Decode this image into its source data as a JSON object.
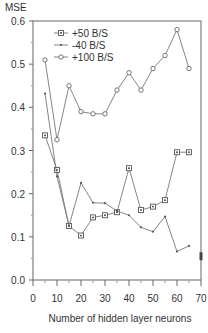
{
  "chart_data": {
    "type": "line",
    "title": "",
    "ylabel": "MSE",
    "xlabel": "Number of hidden layer neurons",
    "xlim": [
      0,
      70
    ],
    "ylim": [
      0.0,
      0.6
    ],
    "xticks": [
      0,
      10,
      20,
      30,
      40,
      50,
      60,
      70
    ],
    "xtick_labels": [
      "0",
      "10",
      "20",
      "30",
      "40",
      "50",
      "60",
      "70"
    ],
    "yticks": [
      0.0,
      0.1,
      0.2,
      0.3,
      0.4,
      0.5,
      0.6
    ],
    "ytick_labels": [
      "0.0",
      "0.1",
      "0.2",
      "0.3",
      "0.4",
      "0.5",
      "0.6"
    ],
    "grid": false,
    "legend_position": "upper left",
    "series": [
      {
        "name": "+50 B/S",
        "marker": "boxed-dot",
        "x": [
          5,
          10,
          15,
          20,
          25,
          30,
          35,
          40,
          45,
          50,
          55,
          60,
          65
        ],
        "values": [
          0.335,
          0.255,
          0.125,
          0.103,
          0.145,
          0.15,
          0.157,
          0.259,
          0.162,
          0.17,
          0.185,
          0.296,
          0.296
        ]
      },
      {
        "name": "-40 B/S",
        "marker": "dot",
        "x": [
          5,
          10,
          15,
          20,
          25,
          30,
          35,
          40,
          45,
          50,
          55,
          60,
          65
        ],
        "values": [
          0.432,
          0.24,
          0.125,
          0.225,
          0.179,
          0.178,
          0.16,
          0.15,
          0.122,
          0.112,
          0.147,
          0.066,
          0.079
        ]
      },
      {
        "name": "+100 B/S",
        "marker": "open-circle",
        "x": [
          5,
          10,
          15,
          20,
          25,
          30,
          35,
          40,
          45,
          50,
          55,
          60,
          65
        ],
        "values": [
          0.51,
          0.325,
          0.45,
          0.39,
          0.385,
          0.385,
          0.44,
          0.48,
          0.44,
          0.49,
          0.52,
          0.58,
          0.49
        ]
      }
    ],
    "annotations": [
      {
        "note": "isolated marker at right axis edge",
        "x": 70,
        "y": 0.055
      }
    ]
  }
}
